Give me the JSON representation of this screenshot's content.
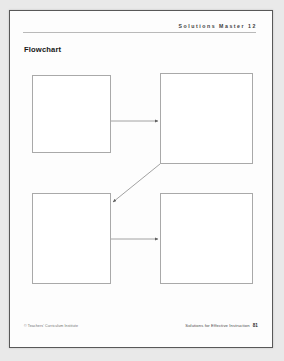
{
  "document": {
    "header_label": "Solutions Master 12",
    "title": "Flowchart",
    "footer_left": "© Teachers' Curriculum Institute",
    "footer_right": "Solutions for Effective Instruction",
    "page_number": "81"
  },
  "flowchart": {
    "boxes": [
      {
        "id": "top-left",
        "label": ""
      },
      {
        "id": "top-right",
        "label": ""
      },
      {
        "id": "bottom-left",
        "label": ""
      },
      {
        "id": "bottom-right",
        "label": ""
      }
    ],
    "connectors": [
      {
        "id": "top-left-to-top-right",
        "style": "horizontal-arrow"
      },
      {
        "id": "top-right-to-bottom-left",
        "style": "diagonal-arrow"
      },
      {
        "id": "bottom-left-to-bottom-right",
        "style": "horizontal-arrow"
      }
    ]
  },
  "colors": {
    "page": "#fdfdfd",
    "page_border": "#585858",
    "box_border": "#a9a9a9",
    "arrow": "#6e6e6e",
    "rule": "#b9b9b9",
    "scan_background": "#e9e9e9"
  }
}
